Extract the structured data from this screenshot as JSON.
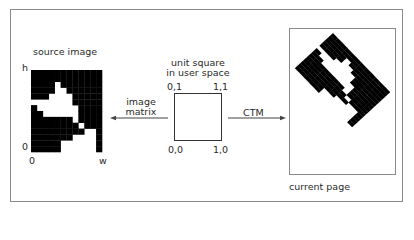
{
  "source": {
    "title": "source image",
    "axis_h": "h",
    "axis_origin_y": "0",
    "axis_origin_x": "0",
    "axis_w": "w"
  },
  "unit_square": {
    "title_line1": "unit square",
    "title_line2": "in user space",
    "corner_tl": "0,1",
    "corner_tr": "1,1",
    "corner_bl": "0,0",
    "corner_br": "1,0"
  },
  "arrows": {
    "image_matrix_line1": "image",
    "image_matrix_line2": "matrix",
    "ctm": "CTM"
  },
  "page": {
    "caption": "current page"
  },
  "bitmap": {
    "cols": 12,
    "rows": 14,
    "pixels": [
      "111111111111",
      "111111111111",
      "111101111111",
      "111100111111",
      "111000011111",
      "000000011111",
      "100000001111",
      "110000001111",
      "111111101111",
      "111111110111",
      "111111111001",
      "111111100001",
      "111110000001",
      "111110000001"
    ],
    "fg_color": "#000000",
    "bg_color": "#ffffff"
  }
}
